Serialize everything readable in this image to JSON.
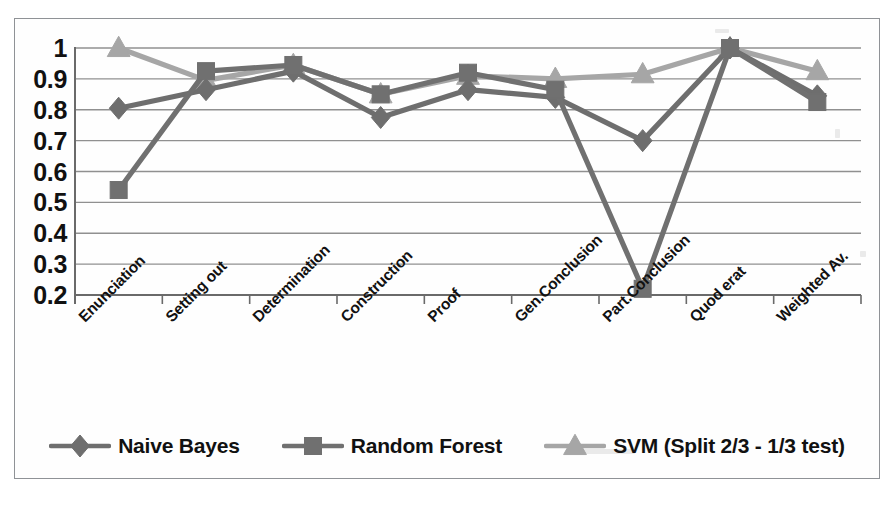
{
  "chart_data": {
    "type": "line",
    "title": "",
    "xlabel": "",
    "ylabel": "",
    "ylim": [
      0.2,
      1.0
    ],
    "ytick_step": 0.1,
    "grid": true,
    "legend_position": "bottom",
    "categories": [
      "Enunciation",
      "Setting out",
      "Determination",
      "Construction",
      "Proof",
      "Gen.Conclusion",
      "Part.Conclusion",
      "Quod erat",
      "Weighted Av."
    ],
    "ytick_labels": [
      "1",
      "0.9",
      "0.8",
      "0.7",
      "0.6",
      "0.5",
      "0.4",
      "0.3",
      "0.2"
    ],
    "ytick_values": [
      1,
      0.9,
      0.8,
      0.7,
      0.6,
      0.5,
      0.4,
      0.3,
      0.2
    ],
    "series": [
      {
        "name": "Naive Bayes",
        "marker": "diamond",
        "color": "#6e6e6e",
        "values": [
          0.805,
          0.865,
          0.925,
          0.775,
          0.865,
          0.84,
          0.7,
          1.0,
          0.845
        ]
      },
      {
        "name": "Random Forest",
        "marker": "square",
        "color": "#707070",
        "values": [
          0.54,
          0.925,
          0.945,
          0.85,
          0.92,
          0.865,
          0.22,
          1.0,
          0.825
        ]
      },
      {
        "name": "SVM (Split 2/3 - 1/3 test)",
        "marker": "triangle",
        "color": "#a6a6a6",
        "values": [
          1.0,
          0.895,
          0.945,
          0.85,
          0.91,
          0.9,
          0.915,
          1.0,
          0.925
        ]
      }
    ]
  },
  "legend": {
    "items": [
      {
        "label": "Naive Bayes"
      },
      {
        "label": "Random Forest"
      },
      {
        "label": "SVM (Split 2/3 - 1/3 test)"
      }
    ]
  },
  "colors": {
    "naive_bayes": "#6e6e6e",
    "random_forest": "#707070",
    "svm": "#a6a6a6",
    "grid": "#909090",
    "axis": "#6a6a6a",
    "frame": "#8f9296",
    "text": "#111111",
    "background": "#ffffff"
  }
}
